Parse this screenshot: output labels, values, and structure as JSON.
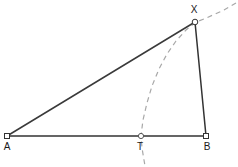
{
  "figure": {
    "canvas": {
      "width": 238,
      "height": 167,
      "background": "#ffffff"
    },
    "style": {
      "solid_stroke_color": "#333333",
      "solid_stroke_width": 1.5,
      "dashed_stroke_color": "#a8a8a8",
      "dashed_stroke_width": 1.2,
      "dash_pattern": "5,4",
      "marker_fill": "#ffffff",
      "marker_stroke": "#333333",
      "label_color": "#1a1a1a",
      "label_font_size": 10
    },
    "points": [
      {
        "id": "A",
        "label": "A",
        "x": 7,
        "y": 136,
        "label_x": 7,
        "label_y": 150,
        "marker": "square"
      },
      {
        "id": "T",
        "label": "T",
        "x": 141,
        "y": 136,
        "label_x": 140,
        "label_y": 150,
        "marker": "circle"
      },
      {
        "id": "B",
        "label": "B",
        "x": 206,
        "y": 136,
        "label_x": 207,
        "label_y": 150,
        "marker": "square"
      },
      {
        "id": "X",
        "label": "X",
        "x": 195,
        "y": 22,
        "label_x": 194,
        "label_y": 13,
        "marker": "circle"
      }
    ],
    "segments": [
      {
        "id": "AB",
        "from": "A",
        "to": "B",
        "style": "solid",
        "label": "segment-AB"
      },
      {
        "id": "AX",
        "from": "A",
        "to": "X",
        "style": "solid",
        "label": "segment-AX"
      },
      {
        "id": "XB",
        "from": "X",
        "to": "B",
        "style": "solid",
        "label": "segment-XB"
      },
      {
        "id": "TB",
        "from": "T",
        "to": "B",
        "style": "solid",
        "label": "segment-TB"
      }
    ],
    "arc": {
      "id": "arc-XT",
      "style": "dashed",
      "description": "circular arc centered near A passing through X and T",
      "path": "M 236 3 L 224 10 L 213 15 L 204 19 L 196 22 L 186 30 L 176 41 L 167 54 L 159 69 L 152 86 L 147 103 L 143 120 L 141 136 L 142 148 L 145 166"
    }
  }
}
